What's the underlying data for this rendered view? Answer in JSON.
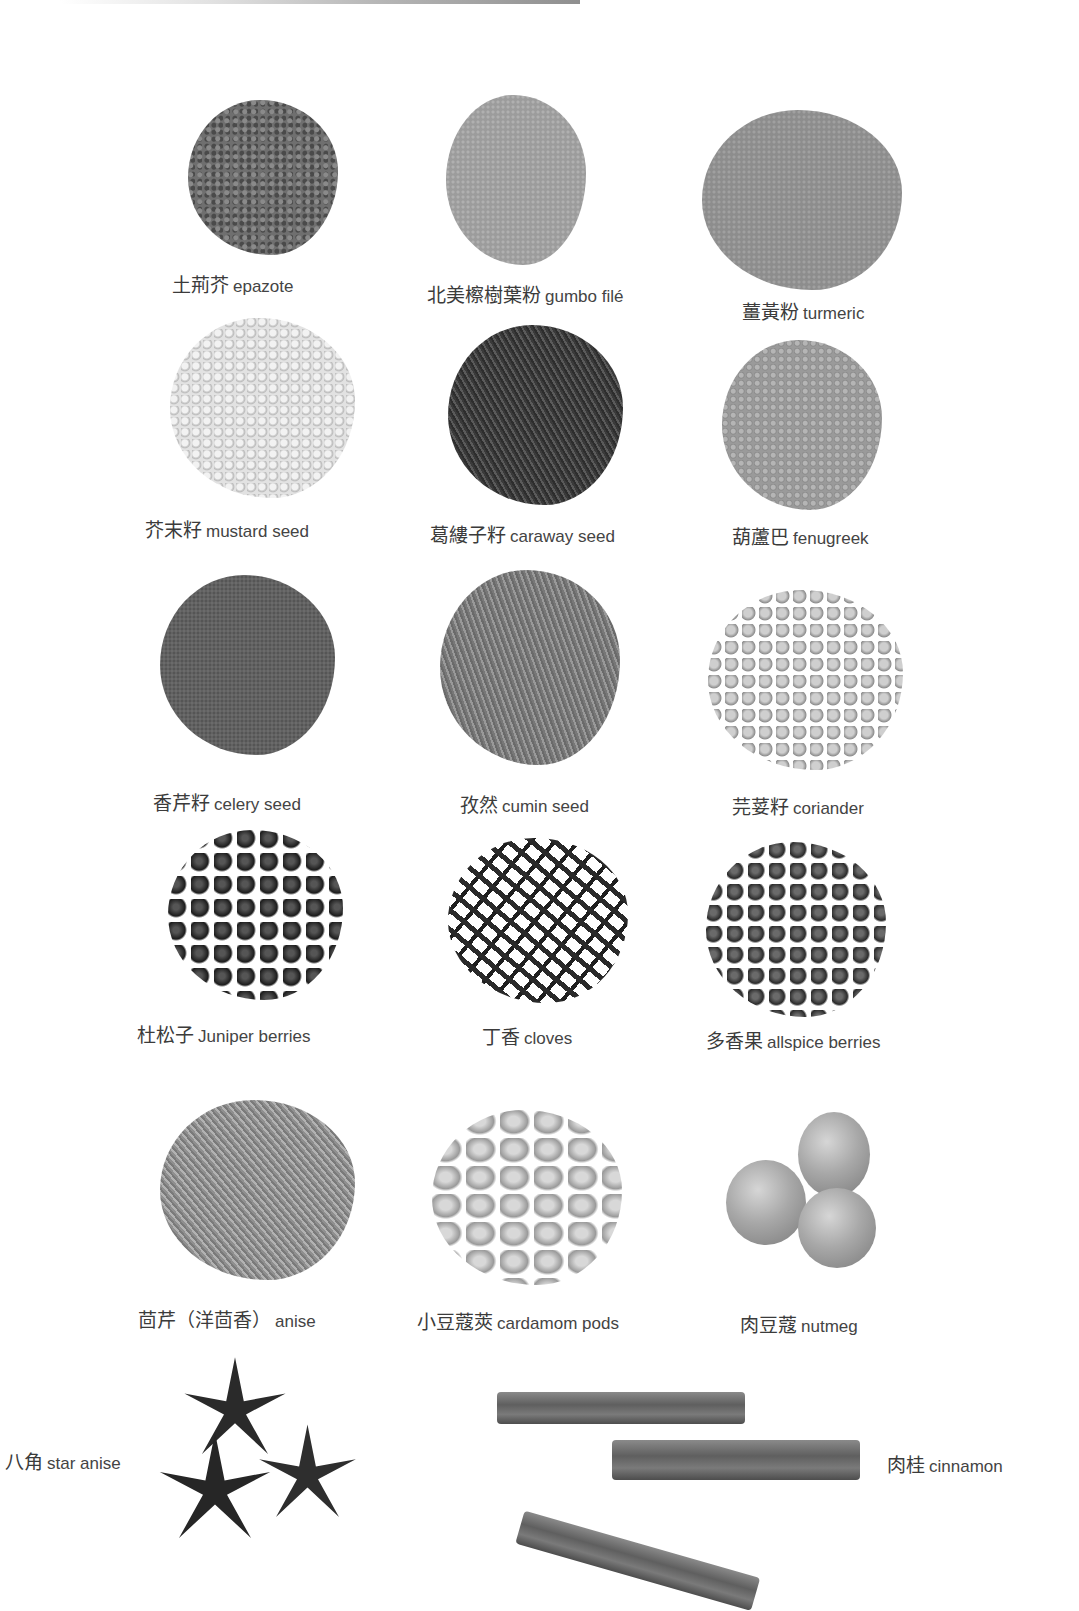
{
  "page": {
    "top_caption_cropped": "",
    "background": "#ffffff",
    "text_color": "#3b3b3b"
  },
  "spices": [
    {
      "zh": "土荊芥",
      "en": "epazote",
      "texture": "leaf"
    },
    {
      "zh": "北美檫樹葉粉",
      "en": "gumbo filé",
      "texture": "powder-light"
    },
    {
      "zh": "薑黃粉",
      "en": "turmeric",
      "texture": "powder"
    },
    {
      "zh": "芥末籽",
      "en": "mustard seed",
      "texture": "bead-light"
    },
    {
      "zh": "葛縷子籽",
      "en": "caraway seed",
      "texture": "seed-dark"
    },
    {
      "zh": "葫蘆巴",
      "en": "fenugreek",
      "texture": "grain"
    },
    {
      "zh": "香芹籽",
      "en": "celery seed",
      "texture": "celery"
    },
    {
      "zh": "孜然",
      "en": "cumin seed",
      "texture": "cumin"
    },
    {
      "zh": "芫荽籽",
      "en": "coriander",
      "texture": "coriander"
    },
    {
      "zh": "杜松子",
      "en": "Juniper berries",
      "texture": "juniper"
    },
    {
      "zh": "丁香",
      "en": "cloves",
      "texture": "cloves"
    },
    {
      "zh": "多香果",
      "en": "allspice berries",
      "texture": "allspice"
    },
    {
      "zh": "茴芹（洋茴香）",
      "en": "anise",
      "texture": "anise"
    },
    {
      "zh": "小豆蔻莢",
      "en": "cardamom pods",
      "texture": "cardamom"
    },
    {
      "zh": "肉豆蔻",
      "en": "nutmeg",
      "texture": "nutmeg"
    },
    {
      "zh": "八角",
      "en": "star anise",
      "texture": "star"
    },
    {
      "zh": "肉桂",
      "en": "cinnamon",
      "texture": "sticks"
    }
  ]
}
